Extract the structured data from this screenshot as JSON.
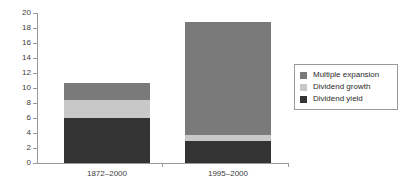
{
  "chart_data": {
    "type": "bar",
    "stacked": true,
    "title": "",
    "xlabel": "",
    "ylabel": "",
    "categories": [
      "1872–2000",
      "1995–2000"
    ],
    "ylim": [
      0,
      20
    ],
    "yticks": [
      0,
      2,
      4,
      6,
      8,
      10,
      12,
      14,
      16,
      18,
      20
    ],
    "ytick_labels": [
      "0",
      "2",
      "4",
      "6",
      "8",
      "10",
      "12",
      "14",
      "16",
      "18",
      "20"
    ],
    "grid": false,
    "legend_position": "right",
    "series": [
      {
        "name": "Dividend yield",
        "color": "#333333",
        "values": [
          6.0,
          3.0
        ]
      },
      {
        "name": "Dividend growth",
        "color": "#c8c8c8",
        "values": [
          2.4,
          0.7
        ]
      },
      {
        "name": "Multiple expansion",
        "color": "#7a7a7a",
        "values": [
          2.3,
          15.1
        ]
      }
    ],
    "totals": [
      10.7,
      18.8
    ],
    "legend_order": [
      "Multiple expansion",
      "Dividend growth",
      "Dividend yield"
    ]
  },
  "legend": {
    "entries": [
      {
        "label": "Multiple expansion",
        "color": "#7a7a7a"
      },
      {
        "label": "Dividend growth",
        "color": "#c8c8c8"
      },
      {
        "label": "Dividend yield",
        "color": "#333333"
      }
    ]
  },
  "axis": {
    "line_color": "#9a9a9a",
    "text_color": "#3c3c3c"
  }
}
